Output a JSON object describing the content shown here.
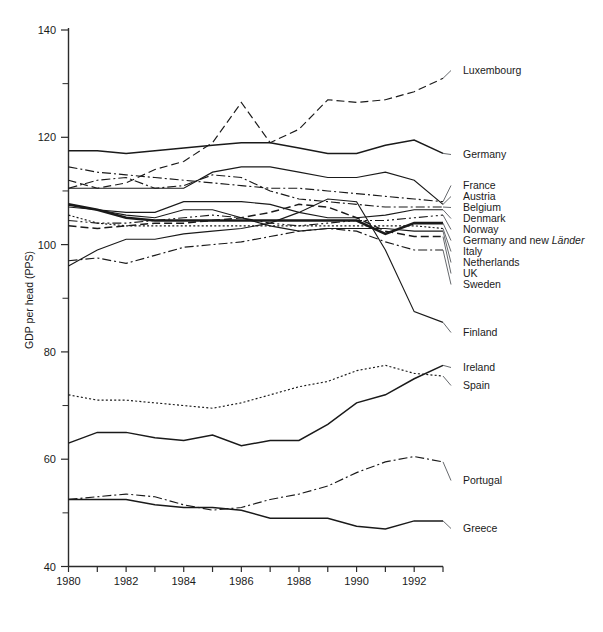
{
  "figure": {
    "caption": "Figure 12.1  GDP per head in EU* and other countries relative to EUR12 average, 1980–1993",
    "y_axis_title": "GDP per head (PPS)"
  },
  "axes": {
    "y_ticks_major": [
      40,
      60,
      80,
      100,
      120,
      140
    ],
    "y_ticks_minor": [
      50,
      70,
      90,
      110,
      130
    ],
    "ylim": [
      40,
      140
    ],
    "x_ticks_labeled": [
      1980,
      1982,
      1984,
      1986,
      1988,
      1990,
      1992
    ],
    "x_ticks_all": [
      1980,
      1981,
      1982,
      1983,
      1984,
      1985,
      1986,
      1987,
      1988,
      1989,
      1990,
      1991,
      1992,
      1993
    ],
    "xlim": [
      1980,
      1993
    ],
    "grid": false
  },
  "labels": {
    "luxembourg": "Luxembourg",
    "germany": "Germany",
    "france": "France",
    "austria": "Austria",
    "belgium": "Belgium",
    "denmark": "Denmark",
    "norway": "Norway",
    "germany_lander_pre": "Germany and new ",
    "germany_lander_ital": "Länder",
    "italy": "Italy",
    "netherlands": "Netherlands",
    "uk": "UK",
    "sweden": "Sweden",
    "finland": "Finland",
    "ireland": "Ireland",
    "spain": "Spain",
    "portugal": "Portugal",
    "greece": "Greece"
  },
  "chart_data": {
    "type": "line",
    "xlabel": "",
    "ylabel": "GDP per head (PPS)",
    "x": [
      1980,
      1981,
      1982,
      1983,
      1984,
      1985,
      1986,
      1987,
      1988,
      1989,
      1990,
      1991,
      1992,
      1993
    ],
    "xlim": [
      1980,
      1993
    ],
    "ylim": [
      40,
      140
    ],
    "grid": false,
    "legend_position": "right-of-plot-with-leader-lines",
    "series": [
      {
        "name": "Luxembourg",
        "style": "dashed",
        "width": "thin",
        "values": [
          112.0,
          110.5,
          111.5,
          114.0,
          115.5,
          119.0,
          126.5,
          119.0,
          121.5,
          127.0,
          126.5,
          127.0,
          128.5,
          131.0
        ]
      },
      {
        "name": "Germany",
        "style": "solid",
        "width": "med",
        "values": [
          117.5,
          117.5,
          117.0,
          117.5,
          118.0,
          118.5,
          119.0,
          119.0,
          118.0,
          117.0,
          117.0,
          118.5,
          119.5,
          117.0
        ]
      },
      {
        "name": "France",
        "style": "dash-dot",
        "width": "thin",
        "values": [
          114.5,
          113.5,
          113.0,
          112.5,
          112.0,
          111.5,
          111.0,
          110.5,
          110.5,
          110.0,
          109.5,
          109.0,
          108.5,
          108.0
        ]
      },
      {
        "name": "Austria",
        "style": "solid",
        "width": "thin",
        "values": [
          110.5,
          110.5,
          110.5,
          110.5,
          110.5,
          113.5,
          114.5,
          114.5,
          113.5,
          112.5,
          112.5,
          113.5,
          112.0,
          107.5
        ]
      },
      {
        "name": "Belgium",
        "style": "dash-dot",
        "width": "thin",
        "values": [
          110.5,
          112.0,
          112.5,
          110.5,
          111.0,
          113.0,
          112.5,
          110.0,
          108.5,
          108.0,
          107.5,
          107.0,
          107.0,
          107.0
        ]
      },
      {
        "name": "Denmark",
        "style": "solid",
        "width": "thin",
        "values": [
          107.0,
          106.5,
          106.0,
          106.0,
          108.0,
          108.0,
          108.0,
          107.5,
          106.0,
          105.0,
          105.0,
          105.5,
          106.5,
          106.5
        ]
      },
      {
        "name": "Norway",
        "style": "dash-dot-dot",
        "width": "thin",
        "values": [
          104.5,
          104.0,
          104.0,
          104.5,
          105.0,
          105.5,
          105.0,
          104.0,
          103.5,
          104.0,
          104.5,
          104.5,
          105.0,
          105.5
        ]
      },
      {
        "name": "Germany and new Länder",
        "style": "solid",
        "width": "bold",
        "values": [
          107.5,
          106.5,
          105.0,
          104.5,
          104.5,
          104.5,
          104.5,
          104.5,
          104.5,
          104.5,
          104.5,
          102.0,
          104.0,
          104.0
        ]
      },
      {
        "name": "Italy",
        "style": "dotted",
        "width": "thin",
        "values": [
          105.5,
          104.0,
          103.5,
          103.5,
          103.5,
          103.5,
          103.5,
          103.5,
          103.5,
          103.5,
          103.5,
          103.5,
          103.5,
          103.0
        ]
      },
      {
        "name": "Netherlands",
        "style": "solid",
        "width": "thin",
        "values": [
          107.5,
          106.5,
          105.5,
          105.0,
          106.5,
          106.5,
          105.0,
          103.5,
          102.5,
          103.0,
          103.0,
          103.0,
          102.5,
          102.5
        ]
      },
      {
        "name": "UK",
        "style": "dashed",
        "width": "med",
        "values": [
          103.5,
          103.0,
          103.5,
          104.0,
          104.0,
          104.5,
          105.0,
          106.0,
          107.5,
          107.0,
          105.0,
          102.5,
          101.5,
          101.5
        ]
      },
      {
        "name": "Sweden",
        "style": "dash-dot",
        "width": "thin",
        "values": [
          97.0,
          97.5,
          96.5,
          98.0,
          99.5,
          100.0,
          100.5,
          101.5,
          102.5,
          103.0,
          102.5,
          100.5,
          99.0,
          99.0
        ]
      },
      {
        "name": "Finland",
        "style": "solid",
        "width": "thin",
        "values": [
          96.0,
          99.0,
          101.0,
          101.0,
          102.0,
          102.5,
          103.0,
          104.0,
          106.0,
          108.5,
          108.0,
          99.0,
          87.5,
          85.5
        ]
      },
      {
        "name": "Ireland",
        "style": "solid",
        "width": "med",
        "values": [
          63.0,
          65.0,
          65.0,
          64.0,
          63.5,
          64.5,
          62.5,
          63.5,
          63.5,
          66.5,
          70.5,
          72.0,
          75.0,
          77.5
        ]
      },
      {
        "name": "Spain",
        "style": "dotted",
        "width": "thin",
        "values": [
          72.0,
          71.0,
          71.0,
          70.5,
          70.0,
          69.5,
          70.5,
          72.0,
          73.5,
          74.5,
          76.5,
          77.5,
          76.0,
          75.5
        ]
      },
      {
        "name": "Portugal",
        "style": "dash-dot",
        "width": "thin",
        "values": [
          52.5,
          53.0,
          53.5,
          53.0,
          51.5,
          50.5,
          51.0,
          52.5,
          53.5,
          55.0,
          57.5,
          59.5,
          60.5,
          59.5
        ]
      },
      {
        "name": "Greece",
        "style": "solid",
        "width": "med",
        "values": [
          52.5,
          52.5,
          52.5,
          51.5,
          51.0,
          51.0,
          50.5,
          49.0,
          49.0,
          49.0,
          47.5,
          47.0,
          48.5,
          48.5
        ]
      }
    ]
  }
}
